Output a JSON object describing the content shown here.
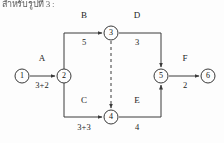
{
  "header": {
    "text": "สำหรับรูปที่ 3 :"
  },
  "diagram": {
    "type": "activity-on-arrow-network",
    "stroke_color": "#3a3a3a",
    "text_color": "#1c1c1c",
    "background": "#fdfdfd",
    "nodes": [
      {
        "id": "1",
        "label": "1",
        "x": 22,
        "y": 76,
        "r": 7
      },
      {
        "id": "2",
        "label": "2",
        "x": 64,
        "y": 76,
        "r": 7
      },
      {
        "id": "3",
        "label": "3",
        "x": 111,
        "y": 33,
        "r": 7
      },
      {
        "id": "4",
        "label": "4",
        "x": 111,
        "y": 117,
        "r": 7
      },
      {
        "id": "5",
        "label": "5",
        "x": 161,
        "y": 76,
        "r": 7
      },
      {
        "id": "6",
        "label": "6",
        "x": 208,
        "y": 76,
        "r": 7
      }
    ],
    "activities": [
      {
        "id": "A",
        "name": "A",
        "duration": "3+2",
        "from": "1",
        "to": "2",
        "label_x": 42,
        "label_y": 62,
        "dur_x": 42,
        "dur_y": 80,
        "style": "solid"
      },
      {
        "id": "B",
        "name": "B",
        "duration": "5",
        "from": "2",
        "to": "3",
        "label_x": 84,
        "label_y": 19,
        "dur_x": 84,
        "dur_y": 37,
        "style": "solid"
      },
      {
        "id": "C",
        "name": "C",
        "duration": "3+3",
        "from": "2",
        "to": "4",
        "label_x": 84,
        "label_y": 103,
        "dur_x": 84,
        "dur_y": 122,
        "style": "solid"
      },
      {
        "id": "D",
        "name": "D",
        "duration": "3",
        "from": "3",
        "to": "5",
        "label_x": 137,
        "label_y": 19,
        "dur_x": 137,
        "dur_y": 37,
        "style": "solid"
      },
      {
        "id": "E",
        "name": "E",
        "duration": "4",
        "from": "4",
        "to": "5",
        "label_x": 137,
        "label_y": 103,
        "dur_x": 137,
        "dur_y": 122,
        "style": "solid"
      },
      {
        "id": "F",
        "name": "F",
        "duration": "2",
        "from": "5",
        "to": "6",
        "label_x": 185,
        "label_y": 62,
        "dur_x": 185,
        "dur_y": 80,
        "style": "solid"
      },
      {
        "id": "dummy",
        "name": "",
        "duration": "",
        "from": "3",
        "to": "4",
        "label_x": 0,
        "label_y": 0,
        "dur_x": 0,
        "dur_y": 0,
        "style": "dashed"
      }
    ]
  }
}
